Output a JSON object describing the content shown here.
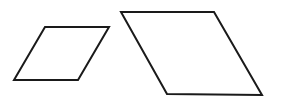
{
  "diagram": {
    "stroke_color": "#1a1a1a",
    "background": "#ffffff",
    "shapes": [
      {
        "name": "small-parallelogram",
        "points": "45,27 109,27 78,80 14,80"
      },
      {
        "name": "large-parallelogram",
        "points": "121,12 214,12 262,95 167,94"
      }
    ]
  }
}
